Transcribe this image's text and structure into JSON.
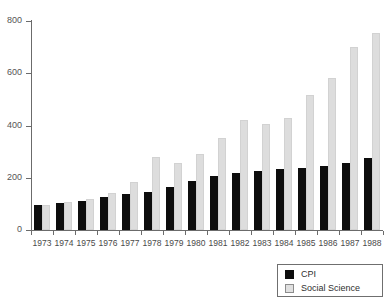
{
  "chart_data": {
    "type": "bar",
    "title": "",
    "xlabel": "",
    "ylabel": "",
    "ylim": [
      0,
      800
    ],
    "yticks": [
      0,
      200,
      400,
      600,
      800
    ],
    "grid": false,
    "legend_position": "bottom-right",
    "categories": [
      "1973",
      "1974",
      "1975",
      "1976",
      "1977",
      "1978",
      "1979",
      "1980",
      "1981",
      "1982",
      "1983",
      "1984",
      "1985",
      "1986",
      "1987",
      "1988"
    ],
    "series": [
      {
        "name": "CPI",
        "color": "#0d0d0d",
        "values": [
          96,
          104,
          112,
          125,
          137,
          145,
          165,
          189,
          208,
          218,
          225,
          232,
          239,
          245,
          258,
          274
        ]
      },
      {
        "name": "Social Science",
        "color": "#dddddd",
        "values": [
          96,
          107,
          118,
          143,
          184,
          279,
          256,
          290,
          352,
          423,
          407,
          430,
          517,
          583,
          701,
          754
        ]
      }
    ]
  },
  "axes": {
    "y_tick_labels": [
      "800",
      "600",
      "400",
      "200",
      "0"
    ]
  },
  "legend": {
    "items": [
      {
        "label": "CPI",
        "swatch": "black-square-icon"
      },
      {
        "label": "Social Science",
        "swatch": "light-gray-square-icon"
      }
    ]
  }
}
